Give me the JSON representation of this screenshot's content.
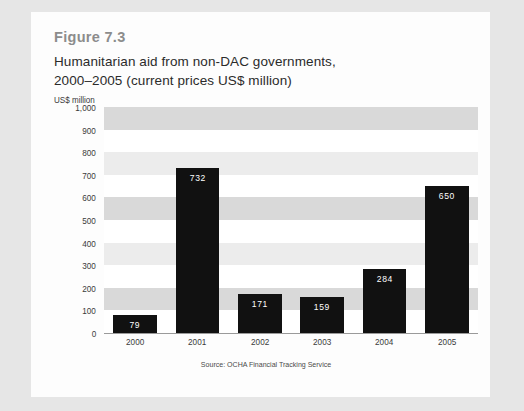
{
  "figure": {
    "number": "Figure 7.3",
    "title_line1": "Humanitarian aid from non-DAC governments,",
    "title_line2": "2000–2005 (current prices US$ million)",
    "unit_label": "US$ million",
    "source": "Source: OCHA Financial Tracking Service"
  },
  "colors": {
    "page_background": "#e6e6e6",
    "card_background": "#fdfdfd",
    "bar": "#111111",
    "band": "#d9d9d9",
    "band_pale": "#ececec",
    "figure_number": "#8c8c8c",
    "text": "#2b2b2b",
    "axis_line": "#9a9a9a",
    "bar_label": "#ffffff"
  },
  "chart_data": {
    "type": "bar",
    "title": "Humanitarian aid from non-DAC governments, 2000–2005 (current prices US$ million)",
    "xlabel": "",
    "ylabel": "US$ million",
    "categories": [
      "2000",
      "2001",
      "2002",
      "2003",
      "2004",
      "2005"
    ],
    "values": [
      79,
      732,
      171,
      159,
      284,
      650
    ],
    "value_labels": [
      "79",
      "732",
      "171",
      "159",
      "284",
      "650"
    ],
    "ylim": [
      0,
      1000
    ],
    "yticks": [
      0,
      100,
      200,
      300,
      400,
      500,
      600,
      700,
      800,
      900,
      1000
    ],
    "ytick_labels": [
      "0",
      "100",
      "200",
      "300",
      "400",
      "500",
      "600",
      "700",
      "800",
      "900",
      "1,000"
    ],
    "grid": "horizontal alternating shaded bands every 100 units",
    "legend": "none",
    "annotations": [
      "Source: OCHA Financial Tracking Service"
    ]
  }
}
